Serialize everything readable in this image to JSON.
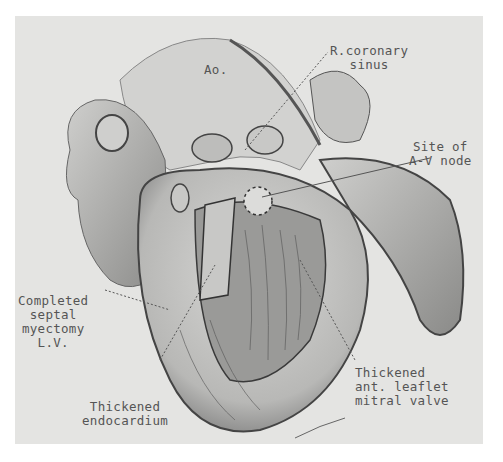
{
  "figure": {
    "background": "#e4e4e2",
    "ink": "#555555",
    "labels": {
      "ao": "Ao.",
      "r_coronary_sinus": [
        "R.coronary",
        "sinus"
      ],
      "av_node": [
        "Site of",
        "A-V node"
      ],
      "septal_myectomy": [
        "Completed",
        "septal",
        "myectomy",
        "L.V."
      ],
      "endocardium": [
        "Thickened",
        "endocardium"
      ],
      "mitral_valve": [
        "Thickened",
        "ant. leaflet",
        "mitral valve"
      ]
    }
  }
}
